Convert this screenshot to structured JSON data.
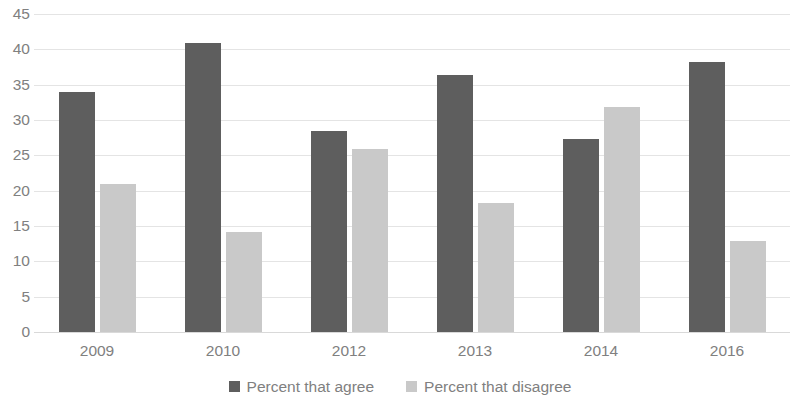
{
  "chart_data": {
    "type": "bar",
    "title": "",
    "subtitle": "",
    "xlabel": "",
    "ylabel": "",
    "categories": [
      "2009",
      "2010",
      "2012",
      "2013",
      "2014",
      "2016"
    ],
    "series": [
      {
        "name": "Percent that agree",
        "color": "#5e5e5e",
        "values": [
          33.9,
          40.9,
          28.5,
          36.4,
          27.3,
          38.2
        ]
      },
      {
        "name": "Percent that disagree",
        "color": "#c9c9c9",
        "values": [
          21.0,
          14.1,
          25.9,
          18.2,
          31.8,
          12.9
        ]
      }
    ],
    "ylim": [
      0,
      45
    ],
    "ytick_step": 5,
    "yticks": [
      0,
      5,
      10,
      15,
      20,
      25,
      30,
      35,
      40,
      45
    ],
    "ytick_labels": [
      "0",
      "5",
      "10",
      "15",
      "20",
      "25",
      "30",
      "35",
      "40",
      "45"
    ],
    "grid": true,
    "grid_axis": "y",
    "legend": true,
    "legend_position": "bottom",
    "legend_entries": [
      "Percent that agree",
      "Percent that disagree"
    ],
    "background_color": "#ffffff",
    "gridline_color": "#e4e4e4",
    "tick_label_color": "#808080"
  }
}
